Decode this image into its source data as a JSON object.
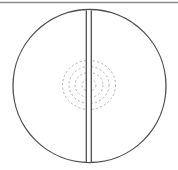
{
  "canvas": {
    "width": 178,
    "height": 170,
    "background": "#ffffff"
  },
  "top_rule": {
    "name": "top-divider-rule",
    "x1": 0,
    "y1": 2.5,
    "x2": 178,
    "y2": 2.5,
    "color": "#888888",
    "width": 1.4
  },
  "figure": {
    "title": "",
    "caption": "",
    "outer_circle": {
      "label": "outer-circle-outline",
      "cx": 89.5,
      "cy": 86,
      "r": 76.5,
      "stroke": "#4f4f4f",
      "stroke_width": 1.3,
      "fill": "none"
    },
    "split_line": {
      "label": "vertical-split-seam",
      "left_x": 86.3,
      "right_x": 91.3,
      "y_top": 10.5,
      "y_bottom": 162.0,
      "stroke": "#4f4f4f",
      "stroke_width": 1.3,
      "gap_fill": "#ffffff"
    },
    "contour_rings": {
      "label": "concentric-dashed-contours",
      "cx": 89.0,
      "cy": 85.0,
      "stroke": "#b3b3b3",
      "stroke_width": 1.0,
      "dash": "2.2 2.2",
      "count": 4,
      "ellipses": [
        {
          "rx": 7.0,
          "ry": 6.0
        },
        {
          "rx": 14.0,
          "ry": 12.5
        },
        {
          "rx": 20.0,
          "ry": 18.5
        },
        {
          "rx": 26.5,
          "ry": 24.5
        }
      ]
    }
  },
  "colors": {
    "outline": "#4f4f4f",
    "contour": "#b3b3b3",
    "rule": "#888888",
    "background": "#ffffff"
  }
}
